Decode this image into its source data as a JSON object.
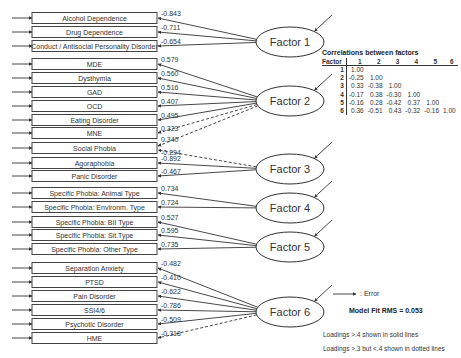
{
  "indicators": [
    {
      "label": "Alcohol Dependence",
      "y": 18,
      "loading": "-0.843",
      "factor": 0,
      "style": "solid"
    },
    {
      "label": "Drug Dependence",
      "y": 32,
      "loading": "-0.711",
      "factor": 0,
      "style": "solid"
    },
    {
      "label": "Conduct / Antisocial Personality Disorder",
      "y": 46,
      "loading": "-0.654",
      "factor": 0,
      "style": "solid"
    },
    {
      "label": "MDE",
      "y": 64,
      "loading": "0.579",
      "factor": 1,
      "style": "solid"
    },
    {
      "label": "Dysthymia",
      "y": 78,
      "loading": "0.560",
      "factor": 1,
      "style": "solid"
    },
    {
      "label": "GAD",
      "y": 92,
      "loading": "0.516",
      "factor": 1,
      "style": "solid"
    },
    {
      "label": "OCD",
      "y": 106,
      "loading": "0.407",
      "factor": 1,
      "style": "solid"
    },
    {
      "label": "Eating Disorder",
      "y": 120,
      "loading": "0.495",
      "factor": 1,
      "style": "solid"
    },
    {
      "label": "MNE",
      "y": 133,
      "loading": "0.323",
      "factor": 1,
      "style": "dotted"
    },
    {
      "label": "Social Phobia",
      "y": 148,
      "loading": "0.340",
      "factor": 1,
      "style": "dotted",
      "extra": {
        "loading": "-0.294",
        "factor": 2,
        "style": "dotted"
      }
    },
    {
      "label": "Agoraphobia",
      "y": 163,
      "loading": "-0.892",
      "factor": 2,
      "style": "solid"
    },
    {
      "label": "Panic Disorder",
      "y": 176,
      "loading": "-0.467",
      "factor": 2,
      "style": "solid"
    },
    {
      "label": "Specific Phobia: Animal Type",
      "y": 193,
      "loading": "0.734",
      "factor": 3,
      "style": "solid"
    },
    {
      "label": "Specific Phobia: Environm. Type",
      "y": 207,
      "loading": "0.724",
      "factor": 3,
      "style": "solid"
    },
    {
      "label": "Specific Phobia: BII Type",
      "y": 222,
      "loading": "0.527",
      "factor": 4,
      "style": "solid"
    },
    {
      "label": "Specific Phobia: Sit.Type",
      "y": 235,
      "loading": "0.595",
      "factor": 4,
      "style": "solid"
    },
    {
      "label": "Specific Phobia: Other Type",
      "y": 249,
      "loading": "0.735",
      "factor": 4,
      "style": "solid"
    },
    {
      "label": "Separation Anxiety",
      "y": 268,
      "loading": "-0.482",
      "factor": 5,
      "style": "solid"
    },
    {
      "label": "PTSD",
      "y": 282,
      "loading": "-0.410",
      "factor": 5,
      "style": "solid"
    },
    {
      "label": "Pain Disorder",
      "y": 296,
      "loading": "-0.622",
      "factor": 5,
      "style": "solid"
    },
    {
      "label": "SSI4/6",
      "y": 310,
      "loading": "-0.786",
      "factor": 5,
      "style": "solid"
    },
    {
      "label": "Psychotic Disorder",
      "y": 324,
      "loading": "-0.509",
      "factor": 5,
      "style": "solid"
    },
    {
      "label": "HME",
      "y": 338,
      "loading": "-0.318",
      "factor": 5,
      "style": "dotted"
    }
  ],
  "factors": [
    {
      "label": "Factor 1",
      "cx": 290,
      "cy": 42
    },
    {
      "label": "Factor 2",
      "cx": 290,
      "cy": 101
    },
    {
      "label": "Factor 3",
      "cx": 290,
      "cy": 169
    },
    {
      "label": "Factor 4",
      "cx": 290,
      "cy": 208
    },
    {
      "label": "Factor 5",
      "cx": 290,
      "cy": 247
    },
    {
      "label": "Factor 6",
      "cx": 290,
      "cy": 312
    }
  ],
  "correlations": {
    "title": "Correlations between factors",
    "header_label": "Factor",
    "columns": [
      "1",
      "2",
      "3",
      "4",
      "5",
      "6"
    ],
    "rows": [
      {
        "factor": "1",
        "values": [
          "1.00",
          "",
          "",
          "",
          "",
          ""
        ]
      },
      {
        "factor": "2",
        "values": [
          "-0.25",
          "1.00",
          "",
          "",
          "",
          ""
        ]
      },
      {
        "factor": "3",
        "values": [
          "0.33",
          "-0.38",
          "1.00",
          "",
          "",
          ""
        ]
      },
      {
        "factor": "4",
        "values": [
          "-0.17",
          "0.38",
          "-0.30",
          "1.00",
          "",
          ""
        ]
      },
      {
        "factor": "5",
        "values": [
          "-0.16",
          "0.28",
          "-0.42",
          "0.37",
          "1.00",
          ""
        ]
      },
      {
        "factor": "6",
        "values": [
          "0.36",
          "-0.51",
          "0.43",
          "-0.32",
          "-0.16",
          "1.00"
        ]
      }
    ]
  },
  "legend": {
    "error_label": ": Error",
    "model_fit": "Model Fit RMS = 0.053",
    "note_solid": "Loadings >.4 shown in solid lines",
    "note_dotted": "Loadings >.3 but <.4 shown in dotted lines"
  },
  "colors": {
    "line": "#333333",
    "box_border": "#444444",
    "background": "#ffffff"
  }
}
